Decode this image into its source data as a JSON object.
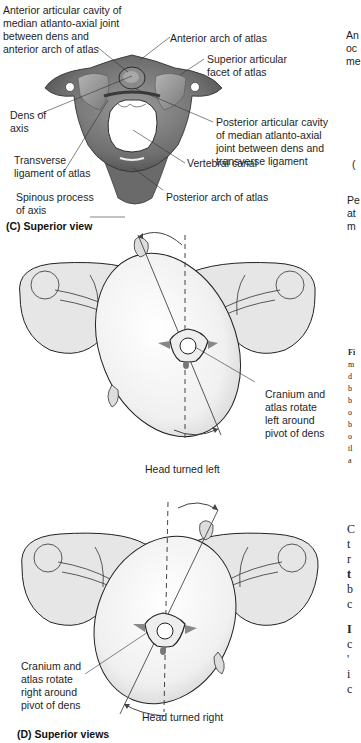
{
  "panel_c": {
    "caption": "(C) Superior view",
    "labels": {
      "anterior_cavity_1": "Anterior articular cavity of",
      "anterior_cavity_2": "median atlanto-axial joint",
      "anterior_cavity_3": "between dens and",
      "anterior_cavity_4": "anterior arch of atlas",
      "anterior_arch": "Anterior arch of atlas",
      "superior_facet_1": "Superior articular",
      "superior_facet_2": "facet of atlas",
      "dens_1": "Dens of",
      "dens_2": "axis",
      "posterior_cavity_1": "Posterior articular cavity",
      "posterior_cavity_2": "of median atlanto-axial",
      "posterior_cavity_3": "joint between dens and",
      "posterior_cavity_4": "transverse ligament",
      "transverse_lig_1": "Transverse",
      "transverse_lig_2": "ligament of atlas",
      "vertebral_canal": "Vertebral canal",
      "spinous_1": "Spinous process",
      "spinous_2": "of axis",
      "posterior_arch": "Posterior arch of atlas"
    }
  },
  "panel_d": {
    "caption": "(D) Superior views",
    "top": {
      "rotation_1": "Cranium and",
      "rotation_2": "atlas rotate",
      "rotation_3": "left around",
      "rotation_4": "pivot of dens",
      "head_label": "Head turned left"
    },
    "bottom": {
      "rotation_1": "Cranium and",
      "rotation_2": "atlas rotate",
      "rotation_3": "right around",
      "rotation_4": "pivot of dens",
      "head_label": "Head turned right"
    }
  },
  "right_edge_fragments": {
    "top_1": "An",
    "top_2": "oc",
    "top_3": "me",
    "mid_1": "(",
    "mid_2": "Pe",
    "mid_3": "at",
    "mid_4": "m",
    "fig_1": "Fi",
    "fig_2": "m",
    "fig_3": "d",
    "fig_4": "b",
    "fig_5": "b",
    "fig_6": "o",
    "fig_7": "b",
    "fig_8": "o",
    "fig_9": "tl",
    "fig_10": "a",
    "body_1": "C",
    "body_2": "t",
    "body_3": "r",
    "body_4": "t",
    "body_5": "b",
    "body_6": "c",
    "body_7": "I",
    "body_8": "c",
    "body_9": "'",
    "body_10": "i",
    "body_11": "c"
  }
}
